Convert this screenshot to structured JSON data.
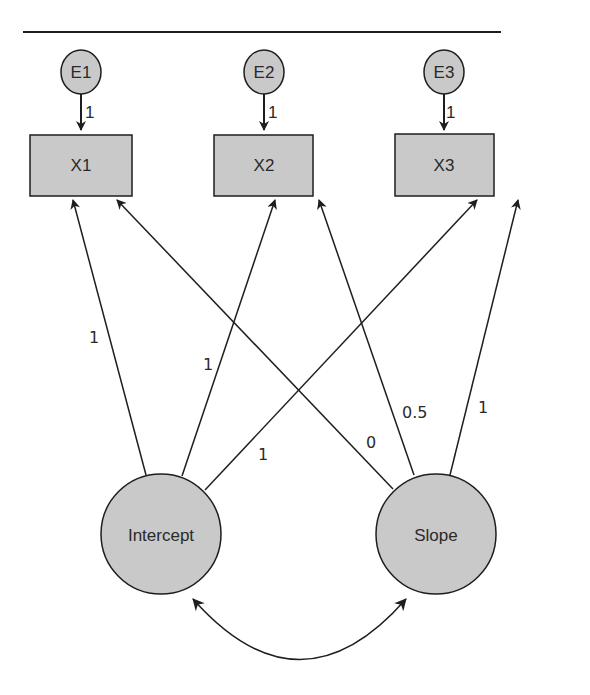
{
  "diagram": {
    "type": "latent growth curve model (path diagram)",
    "colors": {
      "node_fill": "#c9c9c9",
      "stroke": "#1e1e1e",
      "text": "#2a2a2a",
      "background": "#ffffff"
    },
    "errors": [
      {
        "id": "E1",
        "label": "E1",
        "loading": "1"
      },
      {
        "id": "E2",
        "label": "E2",
        "loading": "1"
      },
      {
        "id": "E3",
        "label": "E3",
        "loading": "1"
      }
    ],
    "observed": [
      {
        "id": "X1",
        "label": "X1"
      },
      {
        "id": "X2",
        "label": "X2"
      },
      {
        "id": "X3",
        "label": "X3"
      }
    ],
    "latent": [
      {
        "id": "intercept",
        "label": "Intercept"
      },
      {
        "id": "slope",
        "label": "Slope"
      }
    ],
    "paths": [
      {
        "from": "Intercept",
        "to": "X1",
        "label": "1"
      },
      {
        "from": "Intercept",
        "to": "X2",
        "label": "1"
      },
      {
        "from": "Intercept",
        "to": "X3",
        "label": "1"
      },
      {
        "from": "Slope",
        "to": "X1",
        "label": "0"
      },
      {
        "from": "Slope",
        "to": "X2",
        "label": "0.5"
      },
      {
        "from": "Slope",
        "to": "X3",
        "label": "1"
      }
    ],
    "covariance": {
      "between": [
        "Intercept",
        "Slope"
      ],
      "label": ""
    }
  }
}
